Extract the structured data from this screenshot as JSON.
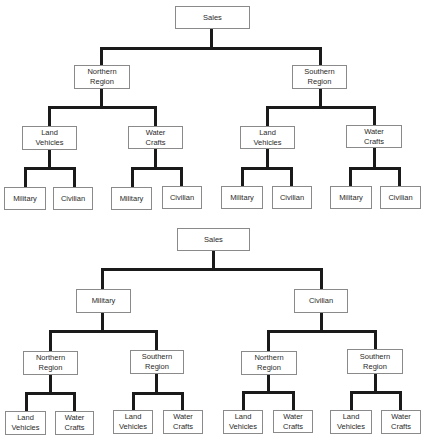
{
  "diagrams": [
    {
      "title": "Sales by Region first",
      "root": "Sales",
      "level1": [
        "Northern\nRegion",
        "Southern\nRegion"
      ],
      "level2": [
        "Land\nVehicles",
        "Water\nCrafts",
        "Land\nVehicles",
        "Water\nCrafts"
      ],
      "level3": [
        "Military",
        "Civilian",
        "Military",
        "Civilian",
        "Military",
        "Civilian",
        "Military",
        "Civilian"
      ]
    },
    {
      "title": "Sales by Market first",
      "root": "Sales",
      "level1": [
        "Military",
        "Civilian"
      ],
      "level2": [
        "Northern\nRegion",
        "Southern\nRegion",
        "Northern\nRegion",
        "Southern\nRegion"
      ],
      "level3": [
        "Land\nVehicles",
        "Water\nCrafts",
        "Land\nVehicles",
        "Water\nCrafts",
        "Land\nVehicles",
        "Water\nCrafts",
        "Land\nVehicles",
        "Water\nCrafts"
      ]
    }
  ],
  "colors": {
    "line": "#1a1a1a",
    "border": "#8a8a8a",
    "text": "#2a2a2a",
    "background": "#ffffff"
  }
}
